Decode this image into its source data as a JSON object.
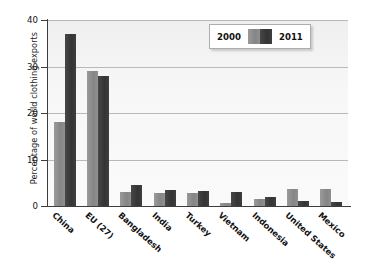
{
  "chart_data": {
    "type": "bar",
    "title": "",
    "xlabel": "",
    "ylabel": "Percentage of world clothing exports",
    "ylim": [
      0,
      40
    ],
    "yticks": [
      0,
      10,
      20,
      30,
      40
    ],
    "ytick_labels": [
      "0",
      "10",
      "20",
      "30",
      "40"
    ],
    "grid": true,
    "legend_position": "top-right",
    "categories": [
      "China",
      "EU (27)",
      "Bangladesh",
      "India",
      "Turkey",
      "Vietnam",
      "Indonesia",
      "United States",
      "Mexico"
    ],
    "series": [
      {
        "name": "2000",
        "color": "#8d8d8d",
        "values": [
          18.0,
          29.0,
          3.0,
          2.9,
          2.8,
          0.7,
          1.6,
          3.7,
          3.7
        ]
      },
      {
        "name": "2011",
        "color": "#3c3c3c",
        "values": [
          37.0,
          28.0,
          4.6,
          3.4,
          3.2,
          3.0,
          1.9,
          1.1,
          0.8
        ]
      }
    ]
  },
  "legend": {
    "label_left": "2000",
    "label_right": "2011"
  }
}
